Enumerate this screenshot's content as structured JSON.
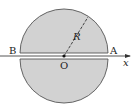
{
  "diagram": {
    "colors": {
      "fill": "#d2d2d2",
      "stroke": "#555555",
      "axis": "#444444"
    },
    "labels": {
      "left_end": "B",
      "right_end": "A",
      "center": "O",
      "radius": "R",
      "axis": "x"
    }
  }
}
